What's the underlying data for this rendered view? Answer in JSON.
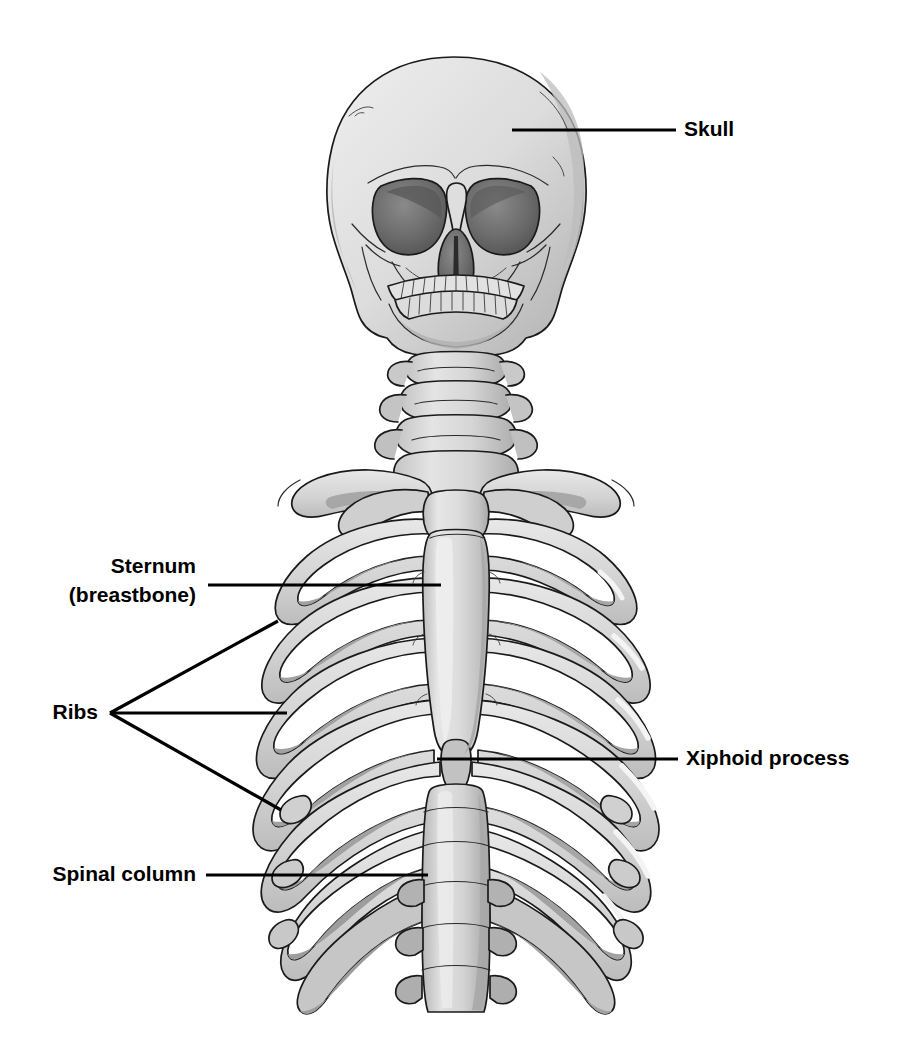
{
  "figure": {
    "background_color": "#ffffff",
    "ink_color": "#000000",
    "view": "anterior"
  },
  "palette": {
    "bone_light": "#dcdcdc",
    "bone_mid": "#c9c9c9",
    "bone_shadow": "#a6a6a6",
    "bone_deep_shadow": "#8e8e8e",
    "bone_highlight": "#f2f2f2",
    "cavity_dark": "#6f6f6f",
    "cavity_darker": "#545454",
    "outline": "#1a1a1a",
    "label_color": "#000000",
    "leader_color": "#000000"
  },
  "labels": [
    {
      "id": "skull",
      "text": "Skull",
      "text_x": 684,
      "text_y": 130,
      "anchor": "start",
      "lines": [
        [
          512,
          130,
          676,
          130
        ]
      ],
      "target": "cranium-right-parietal"
    },
    {
      "id": "sternum",
      "text_lines": [
        "Sternum",
        "(breastbone)"
      ],
      "text_x": 196,
      "text_y": 567,
      "line_height": 29,
      "anchor": "end",
      "lines": [
        [
          208,
          585,
          441,
          585
        ]
      ],
      "target": "sternum-body"
    },
    {
      "id": "ribs",
      "text": "Ribs",
      "text_x": 98,
      "text_y": 713,
      "anchor": "end",
      "fan_origin": [
        110,
        713
      ],
      "lines": [
        [
          110,
          713,
          278,
          621
        ],
        [
          110,
          713,
          287,
          713
        ],
        [
          110,
          713,
          281,
          810
        ]
      ],
      "target": "rib-cage-left-lateral"
    },
    {
      "id": "xiphoid",
      "text": "Xiphoid process",
      "text_x": 686,
      "text_y": 759,
      "anchor": "start",
      "lines": [
        [
          437,
          759,
          678,
          759
        ]
      ],
      "target": "xiphoid-process"
    },
    {
      "id": "spinal-column",
      "text": "Spinal column",
      "text_x": 196,
      "text_y": 875,
      "anchor": "end",
      "lines": [
        [
          206,
          875,
          428,
          875
        ]
      ],
      "target": "lumbar-vertebrae"
    }
  ],
  "anatomy": {
    "parts": [
      {
        "name": "cranium",
        "label": "Skull"
      },
      {
        "name": "orbit-left",
        "label": "Left eye socket"
      },
      {
        "name": "orbit-right",
        "label": "Right eye socket"
      },
      {
        "name": "nasal-aperture",
        "label": "Nasal aperture"
      },
      {
        "name": "maxilla-teeth",
        "label": "Upper teeth"
      },
      {
        "name": "mandible-teeth",
        "label": "Lower teeth"
      },
      {
        "name": "mandible",
        "label": "Jawbone"
      },
      {
        "name": "cervical-vertebrae",
        "label": "Cervical vertebrae"
      },
      {
        "name": "clavicle-left",
        "label": "Left collarbone"
      },
      {
        "name": "clavicle-right",
        "label": "Right collarbone"
      },
      {
        "name": "manubrium",
        "label": "Manubrium"
      },
      {
        "name": "sternum-body",
        "label": "Sternum (breastbone)"
      },
      {
        "name": "xiphoid-process",
        "label": "Xiphoid process"
      },
      {
        "name": "ribs",
        "label": "Ribs",
        "pairs": 12
      },
      {
        "name": "thoracic-vertebrae",
        "label": "Thoracic vertebrae"
      },
      {
        "name": "lumbar-vertebrae",
        "label": "Lumbar vertebrae"
      }
    ],
    "rib_pair_count": 12,
    "cervical_vertebra_count": 5,
    "lumbar_vertebra_count": 5
  }
}
